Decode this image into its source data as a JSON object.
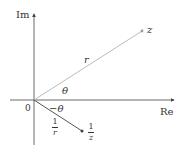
{
  "axes": {
    "x_label": "Re",
    "y_label": "Im",
    "origin_label": "0"
  },
  "points": {
    "z": {
      "label": "z"
    },
    "reciprocal": {
      "label_num": "1",
      "label_den": "z"
    }
  },
  "segments": {
    "to_z": {
      "length_label": "r",
      "angle_label": "θ"
    },
    "to_reciprocal": {
      "length_num": "1",
      "length_den": "r",
      "angle_label": "−θ"
    }
  },
  "colors": {
    "axis": "#444444",
    "ray_z": "#bbbbbb",
    "ray_reciprocal": "#555555",
    "text": "#333333"
  }
}
